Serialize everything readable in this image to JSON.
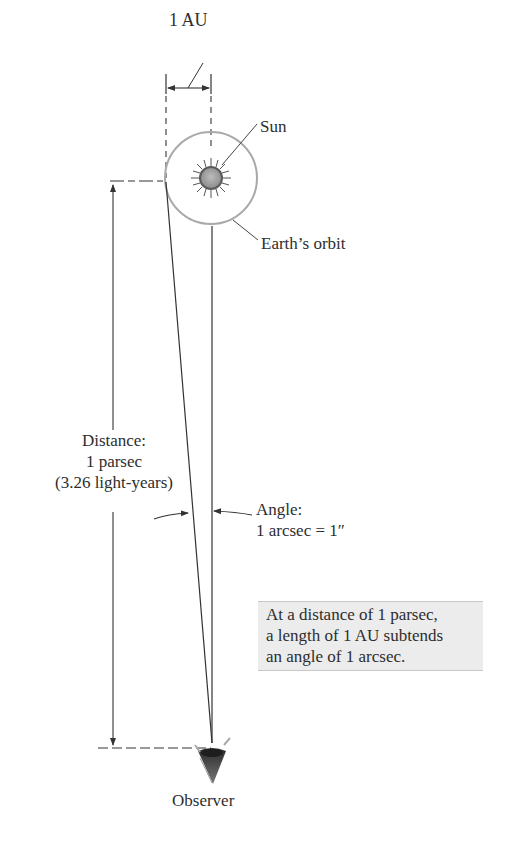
{
  "diagram": {
    "labels": {
      "au": "1 AU",
      "sun": "Sun",
      "orbit": "Earth’s orbit",
      "distance": [
        "Distance:",
        "1 parsec",
        "(3.26 light-years)"
      ],
      "angle": [
        "Angle:",
        "1 arcsec = 1″"
      ],
      "observer": "Observer"
    },
    "note": {
      "lines": [
        "At a distance of 1 parsec,",
        "a length of 1 AU subtends",
        "an angle of 1 arcsec."
      ]
    },
    "colors": {
      "line": "#333333",
      "orbit": "#a9a9a9",
      "sun_fill": "#9a9a9a",
      "note_bg": "#ececec"
    },
    "icons": [
      "sun-icon",
      "eye-icon"
    ]
  }
}
